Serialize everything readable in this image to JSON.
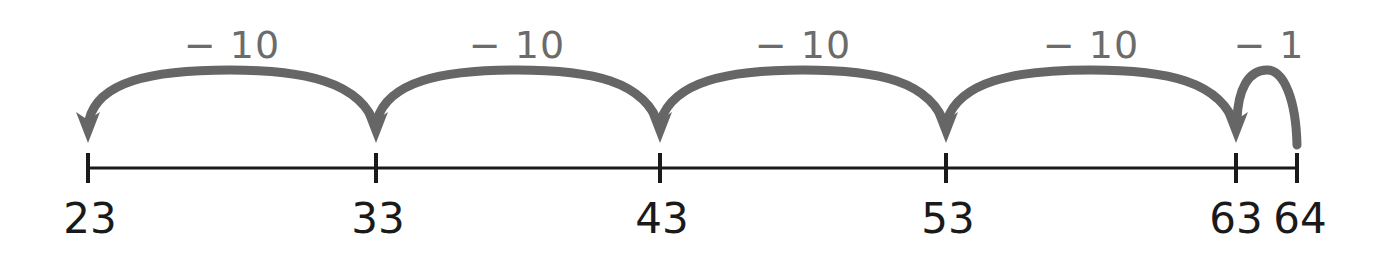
{
  "diagram": {
    "type": "number-line-subtraction",
    "colors": {
      "arrow": "#666666",
      "line": "#1a1a1a",
      "label": "#6b6b6b"
    },
    "ticks": [
      {
        "value": "23",
        "x": 88
      },
      {
        "value": "33",
        "x": 376
      },
      {
        "value": "43",
        "x": 660
      },
      {
        "value": "53",
        "x": 946
      },
      {
        "value": "63",
        "x": 1236
      },
      {
        "value": "64",
        "x": 1297
      }
    ],
    "jumps": [
      {
        "label": "− 10",
        "from": "33",
        "to": "23",
        "label_x": 232
      },
      {
        "label": "− 10",
        "from": "43",
        "to": "33",
        "label_x": 517
      },
      {
        "label": "− 10",
        "from": "53",
        "to": "43",
        "label_x": 803
      },
      {
        "label": "− 10",
        "from": "63",
        "to": "53",
        "label_x": 1091
      },
      {
        "label": "− 1",
        "from": "64",
        "to": "63",
        "label_x": 1269
      }
    ]
  }
}
